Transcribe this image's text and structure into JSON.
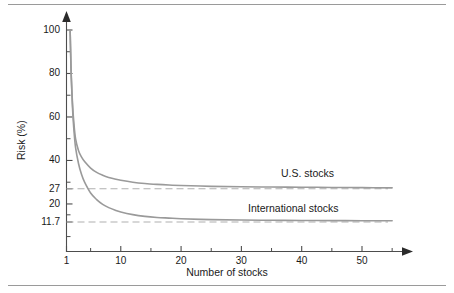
{
  "chart_data": {
    "type": "line",
    "title": "",
    "xlabel": "Number of stocks",
    "ylabel": "Risk (%)",
    "xlim": [
      1,
      55
    ],
    "ylim": [
      0,
      105
    ],
    "grid": false,
    "legend_position": "inline-right",
    "y_ticks": [
      {
        "value": 100,
        "label": "100"
      },
      {
        "value": 80,
        "label": "80"
      },
      {
        "value": 60,
        "label": "60"
      },
      {
        "value": 40,
        "label": "40"
      },
      {
        "value": 27,
        "label": "27"
      },
      {
        "value": 20,
        "label": "20"
      },
      {
        "value": 11.7,
        "label": "11.7"
      }
    ],
    "y_minor_ticks": [
      90,
      70,
      50,
      30,
      15,
      5
    ],
    "x_ticks": [
      {
        "value": 1,
        "label": "1"
      },
      {
        "value": 10,
        "label": "10"
      },
      {
        "value": 20,
        "label": "20"
      },
      {
        "value": 30,
        "label": "30"
      },
      {
        "value": 40,
        "label": "40"
      },
      {
        "value": 50,
        "label": "50"
      }
    ],
    "x_minor_ticks": [
      5,
      15,
      25,
      35,
      45,
      55
    ],
    "series": [
      {
        "name": "U.S. stocks",
        "label": "U.S. stocks",
        "asymptote": 27,
        "color": "#9a9a9a",
        "style": "solid",
        "x": [
          1.6,
          1.7,
          1.8,
          2.0,
          2.2,
          2.5,
          3,
          3.5,
          4,
          5,
          6,
          7,
          8,
          9,
          10,
          12,
          14,
          16,
          18,
          20,
          25,
          30,
          35,
          40,
          45,
          50,
          55
        ],
        "values": [
          100,
          88,
          78,
          66,
          58,
          50,
          44.5,
          41.5,
          39.5,
          36.5,
          34.5,
          33.2,
          32.2,
          31.5,
          30.9,
          30.0,
          29.4,
          29.0,
          28.7,
          28.5,
          28.1,
          27.9,
          27.8,
          27.7,
          27.6,
          27.5,
          27.4
        ]
      },
      {
        "name": "International stocks",
        "label": "International stocks",
        "asymptote": 11.7,
        "color": "#9a9a9a",
        "style": "solid",
        "x": [
          1.6,
          1.7,
          1.8,
          2.0,
          2.2,
          2.5,
          3,
          3.5,
          4,
          5,
          6,
          7,
          8,
          9,
          10,
          12,
          14,
          16,
          18,
          20,
          25,
          30,
          35,
          40,
          45,
          50,
          55
        ],
        "values": [
          100,
          88,
          78,
          64,
          55,
          46,
          38.5,
          33.5,
          30.0,
          25.0,
          22.0,
          19.8,
          18.3,
          17.2,
          16.3,
          15.1,
          14.3,
          13.8,
          13.5,
          13.2,
          12.8,
          12.6,
          12.5,
          12.4,
          12.35,
          12.3,
          12.3
        ]
      }
    ],
    "reference_lines": [
      {
        "name": "us-asymptote",
        "value": 27,
        "label": "27",
        "style": "dashed",
        "color": "#b0b0b0"
      },
      {
        "name": "international-asymptote",
        "value": 11.7,
        "label": "11.7",
        "style": "dashed",
        "color": "#b0b0b0"
      }
    ],
    "colors": {
      "axis": "#4d4d4d",
      "curve": "#9a9a9a",
      "dashed": "#b5b5b5",
      "text": "#1a1a1a",
      "rule": "#9a9a9a",
      "background": "#ffffff"
    }
  }
}
